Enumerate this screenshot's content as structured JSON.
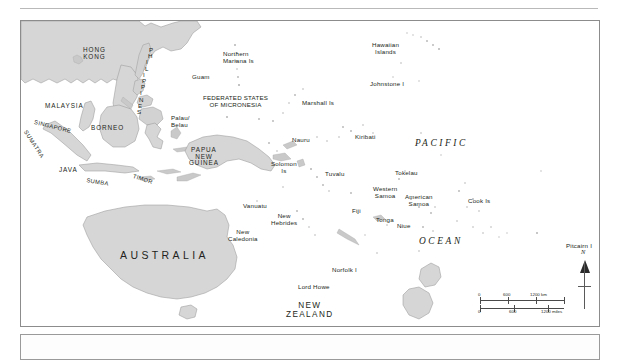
{
  "map": {
    "title_region": "Pacific Ocean and Southeast Asia reference map",
    "ocean_labels": [
      {
        "name": "pacific",
        "text": "PACIFIC"
      },
      {
        "name": "ocean",
        "text": "OCEAN"
      }
    ],
    "continents": [
      {
        "name": "australia",
        "text": "AUSTRALIA"
      },
      {
        "name": "new-zealand",
        "text": "NEW\nZEALAND"
      },
      {
        "name": "tasmania",
        "text": "TASMANIA"
      }
    ],
    "countries": [
      {
        "name": "hong-kong",
        "text": "HONG\nKONG"
      },
      {
        "name": "philippines",
        "text": "PHILIPPINES"
      },
      {
        "name": "malaysia",
        "text": "MALAYSIA"
      },
      {
        "name": "singapore",
        "text": "SINGAPORE"
      },
      {
        "name": "sumatra",
        "text": "SUMATRA"
      },
      {
        "name": "borneo",
        "text": "BORNEO"
      },
      {
        "name": "java",
        "text": "JAVA"
      },
      {
        "name": "sumba",
        "text": "SUMBA"
      },
      {
        "name": "timor",
        "text": "TIMOR"
      },
      {
        "name": "papua-new-guinea",
        "text": "PAPUA\nNEW\nGUINEA"
      }
    ],
    "islands": [
      {
        "name": "northern-mariana-is",
        "text": "Northern\nMariana Is"
      },
      {
        "name": "guam",
        "text": "Guam"
      },
      {
        "name": "hawaiian-islands",
        "text": "Hawaiian\nIslands"
      },
      {
        "name": "johnstone-i",
        "text": "Johnstone I"
      },
      {
        "name": "marshall-is",
        "text": "Marshall Is"
      },
      {
        "name": "federated-states-of-micronesia",
        "text": "FEDERATED STATES\nOF MICRONESIA"
      },
      {
        "name": "palau-belau",
        "text": "Palau/\nBelau"
      },
      {
        "name": "nauru",
        "text": "Nauru"
      },
      {
        "name": "kiribati",
        "text": "Kiribati"
      },
      {
        "name": "solomon-is",
        "text": "Solomon\nIs"
      },
      {
        "name": "tuvalu",
        "text": "Tuvalu"
      },
      {
        "name": "tokelau",
        "text": "Tokelau"
      },
      {
        "name": "vanuatu",
        "text": "Vanuatu"
      },
      {
        "name": "new-hebrides",
        "text": "New\nHebrides"
      },
      {
        "name": "fiji",
        "text": "Fiji"
      },
      {
        "name": "tonga",
        "text": "Tonga"
      },
      {
        "name": "western-samoa",
        "text": "Western\nSamoa"
      },
      {
        "name": "american-samoa",
        "text": "American\nSamoa"
      },
      {
        "name": "niue",
        "text": "Niue"
      },
      {
        "name": "cook-is",
        "text": "Cook Is"
      },
      {
        "name": "new-caledonia",
        "text": "New\nCaledonia"
      },
      {
        "name": "pitcairn-i",
        "text": "Pitcairn I"
      },
      {
        "name": "norfolk-i",
        "text": "Norfolk I"
      },
      {
        "name": "lord-howe",
        "text": "Lord Howe"
      }
    ],
    "scale_bar": {
      "km": {
        "ticks": [
          "0",
          "600",
          "1200 km"
        ]
      },
      "miles": {
        "ticks": [
          "0",
          "600",
          "1200 miles"
        ]
      }
    },
    "compass": {
      "north_label": "N"
    },
    "colors": {
      "land_fill": "#d6d6d6",
      "land_stroke": "#9a9a9a",
      "frame_stroke": "#8c8c8c",
      "text": "#231f20",
      "ocean_fill": "#ffffff"
    }
  }
}
